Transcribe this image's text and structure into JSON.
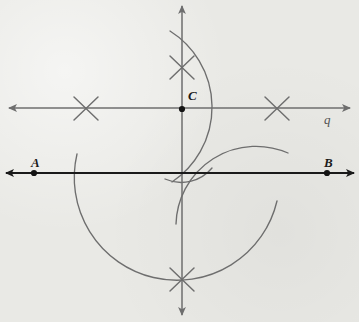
{
  "figure": {
    "background_color": "#e9e9e5",
    "width": 359,
    "height": 322
  },
  "colors": {
    "line_ab": "#1a1a1a",
    "line_q": "#6e6e6e",
    "vertical_line": "#6e6e6e",
    "arc": "#6e6e6e",
    "mark_x": "#6e6e6e",
    "point_dot": "#141414",
    "label_point": "#1b1b1b",
    "label_line": "#545454"
  },
  "labels": {
    "point_a": "A",
    "point_b": "B",
    "point_c": "C",
    "line_q": "q"
  },
  "points": [
    {
      "name": "A",
      "label": "A",
      "x": 34,
      "y": 173,
      "label_x": 31,
      "label_y": 156
    },
    {
      "name": "B",
      "label": "B",
      "x": 327,
      "y": 173,
      "label_x": 324,
      "label_y": 156
    },
    {
      "name": "C",
      "label": "C",
      "x": 182,
      "y": 109,
      "label_x": 188,
      "label_y": 89
    }
  ],
  "lines": [
    {
      "name": "line-ab",
      "label": "",
      "x1": 6,
      "y1": 173,
      "x2": 354,
      "y2": 173,
      "color": "#1a1a1a",
      "width": 2.1,
      "arrow_start": true,
      "arrow_end": true
    },
    {
      "name": "line-q",
      "label": "q",
      "x1": 9,
      "y1": 108,
      "x2": 350,
      "y2": 108,
      "color": "#6e6e6e",
      "width": 1.5,
      "arrow_start": true,
      "arrow_end": true,
      "label_x": 326,
      "label_y": 113
    },
    {
      "name": "vertical-line",
      "label": "",
      "x1": 182,
      "y1": 6,
      "x2": 182,
      "y2": 315,
      "color": "#6e6e6e",
      "width": 1.5,
      "arrow_start": true,
      "arrow_end": true
    }
  ],
  "intersection_marks": [
    {
      "name": "x-mark-left",
      "x": 86,
      "y": 108,
      "size": 13,
      "rotation": 0
    },
    {
      "name": "x-mark-right",
      "x": 277,
      "y": 108,
      "size": 13,
      "rotation": 0
    },
    {
      "name": "x-mark-top",
      "x": 182,
      "y": 67,
      "size": 13,
      "rotation": 0
    },
    {
      "name": "x-mark-bottom",
      "x": 182,
      "y": 279,
      "size": 13,
      "rotation": 0
    }
  ],
  "arcs": [
    {
      "name": "arc-major-right",
      "path": "M 170 31 A 90 90 0 0 1 172 182",
      "description": "large arc centered near C sweeping right from top to line AB"
    },
    {
      "name": "arc-lower-large",
      "path": "M 77 154 A 82 82 0 0 0 277 201",
      "description": "large lower arc crossing line AB on both sides"
    },
    {
      "name": "arc-lower-right",
      "path": "M 288 153 A 80 80 0 0 0 176 224",
      "description": "second lower arc from the right intersecting the first"
    },
    {
      "name": "arc-small-center",
      "path": "M 165 179 A 40 40 0 0 0 212 168",
      "description": "short arc segment just below AB near the center"
    }
  ]
}
